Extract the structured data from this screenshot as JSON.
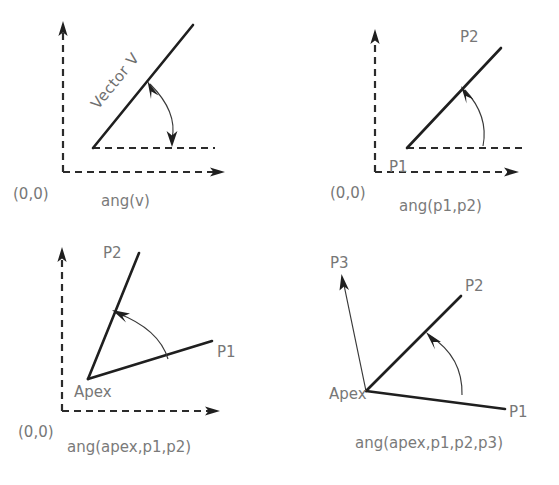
{
  "figure": {
    "background_color": "#ffffff",
    "line_color": "#1f1f1f",
    "text_color": "#777777",
    "axis_style": "dashed"
  },
  "panels": [
    {
      "id": "panel-ang-v",
      "caption": "ang(v)",
      "origin_label": "(0,0)",
      "labels": [
        {
          "name": "vector-label",
          "text": "Vector V"
        }
      ],
      "arc": {
        "double_headed": true,
        "from": "x-axis",
        "to": "vector"
      }
    },
    {
      "id": "panel-ang-p1-p2",
      "caption": "ang(p1,p2)",
      "origin_label": "(0,0)",
      "labels": [
        {
          "name": "point-label-p1",
          "text": "P1"
        },
        {
          "name": "point-label-p2",
          "text": "P2"
        }
      ],
      "arc": {
        "double_headed": false,
        "from": "x-axis",
        "to": "p1-p2"
      }
    },
    {
      "id": "panel-ang-apex-p1-p2",
      "caption": "ang(apex,p1,p2)",
      "origin_label": "(0,0)",
      "labels": [
        {
          "name": "point-label-apex",
          "text": "Apex"
        },
        {
          "name": "point-label-p1",
          "text": "P1"
        },
        {
          "name": "point-label-p2",
          "text": "P2"
        }
      ],
      "arc": {
        "double_headed": false,
        "from": "apex-p1",
        "to": "apex-p2"
      }
    },
    {
      "id": "panel-ang-apex-p1-p2-p3",
      "caption": "ang(apex,p1,p2,p3)",
      "origin_label": "",
      "labels": [
        {
          "name": "point-label-apex",
          "text": "Apex"
        },
        {
          "name": "point-label-p1",
          "text": "P1"
        },
        {
          "name": "point-label-p2",
          "text": "P2"
        },
        {
          "name": "point-label-p3",
          "text": "P3"
        }
      ],
      "arc": {
        "double_headed": false,
        "from": "apex-p1",
        "to": "apex-p2"
      }
    }
  ]
}
